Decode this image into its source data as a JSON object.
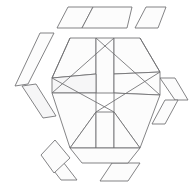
{
  "figure": {
    "kind": "exploded-hexagon-dissection",
    "canvas": {
      "width": 193,
      "height": 186
    },
    "style": {
      "background_color": "#ffffff",
      "stroke_color": "#6e6e70",
      "fill_color": "#fcfcfc",
      "shaded_fill_color": "#f6f6f7",
      "stroke_width": 0.85
    },
    "groups": [
      {
        "name": "detached-top-pieces",
        "label": "Top detached strip",
        "count": 3
      },
      {
        "name": "detached-left-pieces",
        "label": "Left detached strip",
        "count": 2
      },
      {
        "name": "detached-bottom-left-pieces",
        "label": "Bottom-left detached strip",
        "count": 2
      },
      {
        "name": "detached-right-pieces",
        "label": "Right detached wedges",
        "count": 2
      },
      {
        "name": "detached-bottom-right-pieces",
        "label": "Bottom-right detached wedge",
        "count": 1
      },
      {
        "name": "core-hexagon-pieces",
        "label": "Core hexagon pinwheel pieces",
        "count": 10
      }
    ],
    "pieces": [
      {
        "name": "top-piece-left",
        "group": "detached-top-pieces",
        "shaded": false,
        "points": "57,28 68,7 93,7 82,28"
      },
      {
        "name": "top-piece-middle",
        "group": "detached-top-pieces",
        "shaded": false,
        "points": "82,28 93,7 132,7 127,28"
      },
      {
        "name": "top-piece-right",
        "group": "detached-top-pieces",
        "shaded": false,
        "points": "135,28 146,7 166,7 158,28"
      },
      {
        "name": "left-piece-upper",
        "group": "detached-left-pieces",
        "shaded": false,
        "points": "40,33 54,33 28,84 15,86"
      },
      {
        "name": "left-piece-lower",
        "group": "detached-left-pieces",
        "shaded": true,
        "points": "22,86 36,84 56,116 43,118"
      },
      {
        "name": "bottom-left-piece-outer",
        "group": "detached-bottom-left-pieces",
        "shaded": false,
        "points": "44,158 60,158 77,180 61,180"
      },
      {
        "name": "bottom-left-piece-inner",
        "group": "detached-bottom-left-pieces",
        "shaded": false,
        "points": "41,155 55,140 70,158 54,173"
      },
      {
        "name": "right-piece-upper",
        "group": "detached-right-pieces",
        "shaded": false,
        "points": "160,78 175,78 188,100 175,100"
      },
      {
        "name": "right-piece-lower",
        "group": "detached-right-pieces",
        "shaded": false,
        "points": "165,100 178,100 165,124 152,124"
      },
      {
        "name": "bottom-right-piece",
        "group": "detached-bottom-right-pieces",
        "shaded": false,
        "points": "112,163 140,163 128,181 100,181"
      },
      {
        "name": "core-top-left-wedge",
        "group": "core-hexagon-pieces",
        "shaded": false,
        "points": "70,38 96,38 96,74 52,78"
      },
      {
        "name": "core-top-center-bar",
        "group": "core-hexagon-pieces",
        "shaded": false,
        "points": "96,38 114,38 114,93 96,93"
      },
      {
        "name": "core-top-right-wedge",
        "group": "core-hexagon-pieces",
        "shaded": false,
        "points": "114,38 140,38 160,72 114,74"
      },
      {
        "name": "core-left-upper-wedge",
        "group": "core-hexagon-pieces",
        "shaded": true,
        "points": "52,78 96,74 96,93 52,93"
      },
      {
        "name": "core-left-lower-wedge",
        "group": "core-hexagon-pieces",
        "shaded": false,
        "points": "52,93 96,93 96,112 70,148"
      },
      {
        "name": "core-right-upper-wedge",
        "group": "core-hexagon-pieces",
        "shaded": false,
        "points": "114,74 160,72 160,95 114,93"
      },
      {
        "name": "core-right-lower-wedge",
        "group": "core-hexagon-pieces",
        "shaded": false,
        "points": "114,93 160,95 140,148 114,112"
      },
      {
        "name": "core-bottom-left-bar",
        "group": "core-hexagon-pieces",
        "shaded": false,
        "points": "70,148 96,112 96,148"
      },
      {
        "name": "core-bottom-center-bar",
        "group": "core-hexagon-pieces",
        "shaded": false,
        "points": "96,112 114,112 114,148 96,148"
      },
      {
        "name": "core-bottom-right-bar",
        "group": "core-hexagon-pieces",
        "shaded": false,
        "points": "114,112 140,148 114,148"
      },
      {
        "name": "core-bottom-apron",
        "group": "core-hexagon-pieces",
        "shaded": false,
        "points": "70,148 140,148 128,163 82,163"
      }
    ],
    "guide_lines": [
      {
        "name": "hex-outline-upper-left",
        "path": "M 70,38 L 52,78"
      },
      {
        "name": "hex-outline-upper-right",
        "path": "M 140,38 L 160,72"
      },
      {
        "name": "diagonal-sweep-left",
        "path": "M 52,93 L 114,38"
      },
      {
        "name": "diagonal-sweep-right",
        "path": "M 160,95 L 96,38"
      },
      {
        "name": "cross-diagonal-lower-left",
        "path": "M 52,78 L 114,112"
      },
      {
        "name": "cross-diagonal-lower-right",
        "path": "M 160,72 L 96,112"
      }
    ]
  }
}
